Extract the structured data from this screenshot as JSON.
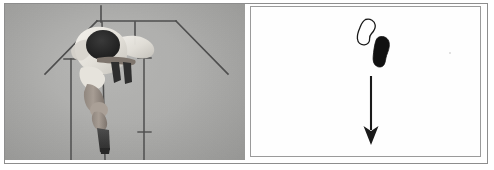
{
  "figure": {
    "caption": "",
    "panel_count": 2,
    "background_color": "#ffffff",
    "frame_color": "#8d8d8d"
  },
  "panels": [
    {
      "id": "photo",
      "kind": "photograph",
      "label": "",
      "background_color": "#b0b0ae",
      "description": "grayscale photograph of a vaulter clearing a bar, viewed head-on",
      "subject": {
        "name": "athlete",
        "head_color": "#2b2b2b",
        "jersey_color": "#eceae4",
        "skin_color": "#9b9189",
        "shoe_color": "#3a3a3a"
      },
      "overlay_lines": {
        "color": "#4a4a4a",
        "apex_label": "",
        "crossbar_label": "",
        "left_upright_label": "",
        "right_upright_label": ""
      }
    },
    {
      "id": "schematic",
      "kind": "diagram",
      "label": "",
      "background_color": "#fefefe",
      "frame_color": "#9a9a9a",
      "shapes": [
        {
          "name": "outline-blob",
          "style": "outline",
          "stroke_color": "#1a1a1a",
          "fill_color": "#ffffff",
          "label": ""
        },
        {
          "name": "solid-blob",
          "style": "filled",
          "stroke_color": "#111111",
          "fill_color": "#111111",
          "label": ""
        }
      ],
      "arrow": {
        "name": "down-arrow",
        "direction": "down",
        "color": "#1a1a1a",
        "label": ""
      }
    }
  ]
}
